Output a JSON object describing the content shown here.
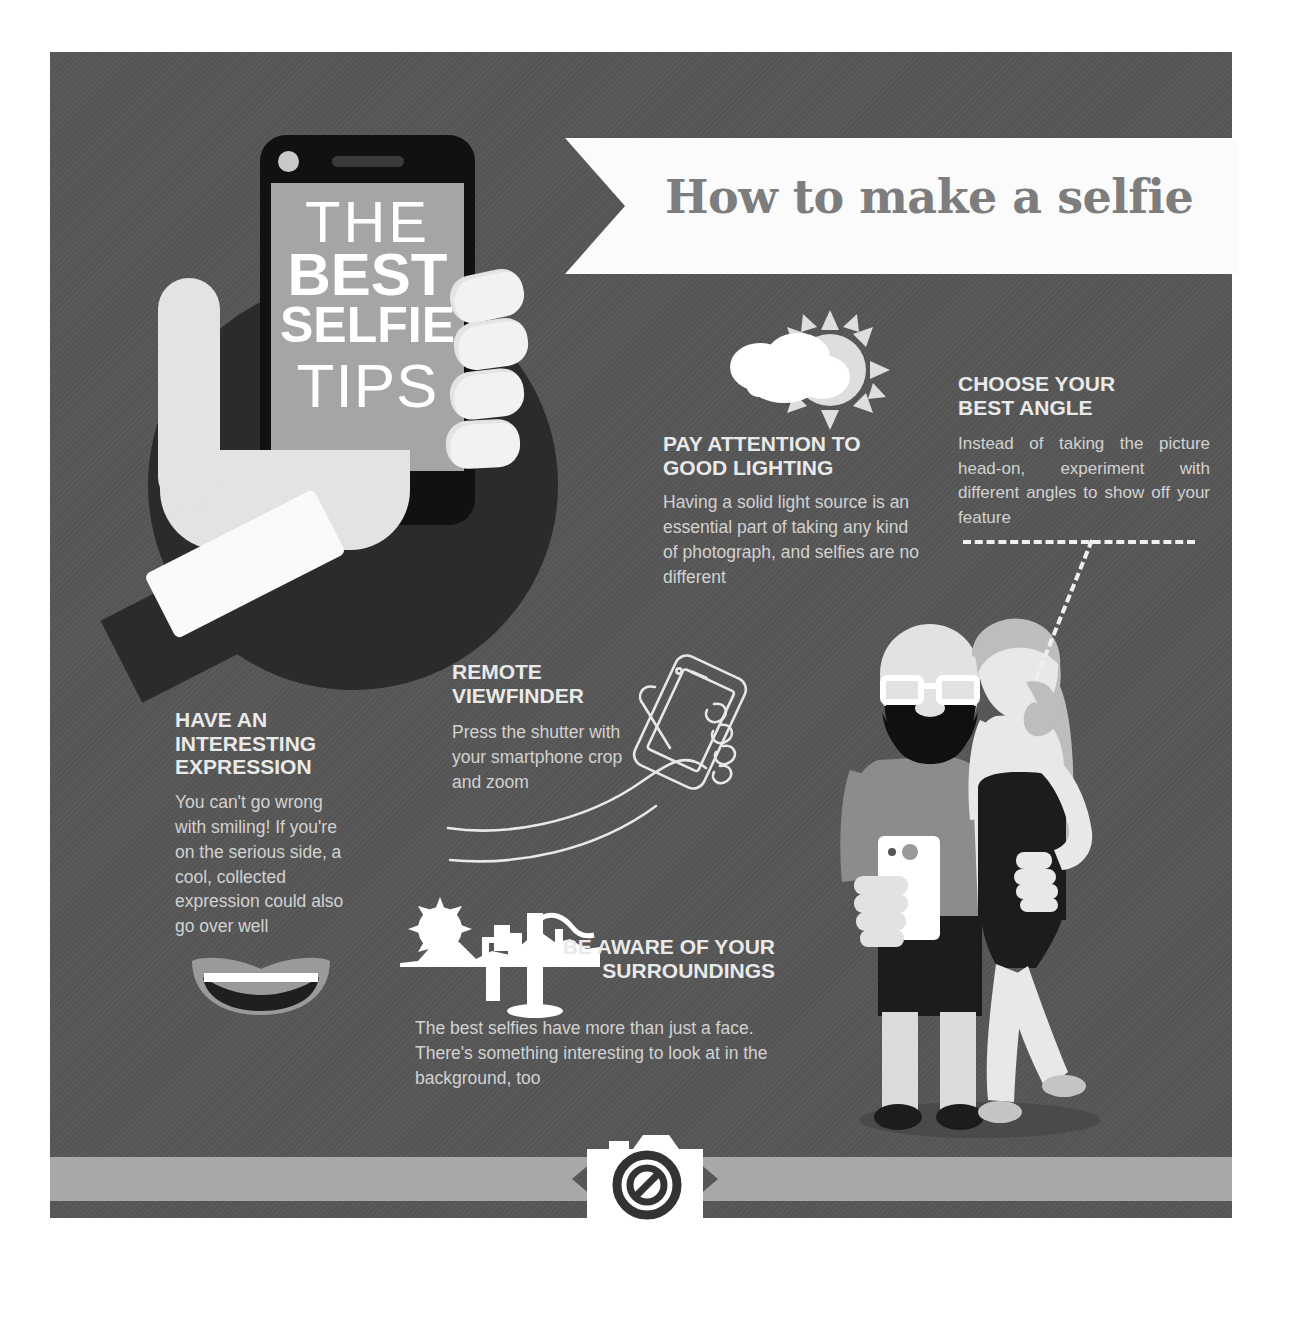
{
  "meta": {
    "canvas_width": 1290,
    "canvas_height": 1326,
    "background_color": "#565656",
    "panel_color": "#565656",
    "accent_light": "#e9e9e9",
    "body_text_color": "#d2d2d2",
    "dark_circle_color": "#2b2b2b",
    "ribbon_color": "#a8a8a8",
    "banner_color": "#fbfbfb",
    "title_color": "#7d7d7d"
  },
  "banner": {
    "title": "How to make a selfie"
  },
  "hero": {
    "screen_lines": {
      "the": "THE",
      "best": "BEST",
      "selfie": "SELFIE",
      "tips": "TIPS"
    },
    "icon_names": {
      "phone": "smartphone-icon",
      "hand": "hand-icon",
      "circle": "background-circle"
    }
  },
  "sections": [
    {
      "id": "lighting",
      "icon": "sun-behind-cloud-icon",
      "heading": "PAY ATTENTION TO\nGOOD LIGHTING",
      "heading_line1": "PAY ATTENTION TO",
      "heading_line2": "GOOD LIGHTING",
      "body": "Having a solid light source is an essential part of taking any kind of photograph, and selfies are no different"
    },
    {
      "id": "angle",
      "icon": "dashed-arrow-icon",
      "heading_line1": "CHOOSE YOUR",
      "heading_line2": "BEST ANGLE",
      "body": "Instead of taking the picture head-on, experiment with different angles to show off your feature"
    },
    {
      "id": "expression",
      "icon": "smiling-mouth-icon",
      "heading_line1": "HAVE AN",
      "heading_line2": "INTERESTING",
      "heading_line3": "EXPRESSION",
      "body": "You can't go wrong with smiling! If you're on the serious side, a cool, collected expression could also go over well"
    },
    {
      "id": "remote-viewfinder",
      "icon": "hand-holding-phone-line-icon",
      "heading_line1": "REMOTE",
      "heading_line2": "VIEWFINDER",
      "body": "Press the shutter with your smartphone crop and zoom"
    },
    {
      "id": "surroundings",
      "icon": "desert-cactus-sun-icon",
      "heading_line1": "BE AWARE OF YOUR",
      "heading_line2": "SURROUNDINGS",
      "body": "The best selfies have more than just a face. There's something interesting to look at in the background, too"
    }
  ],
  "couple": {
    "icon": "couple-taking-selfie-illustration",
    "man": "bearded-man-with-glasses-holding-phone",
    "woman": "woman-in-black-dress-with-ponytail"
  },
  "footer": {
    "icon": "camera-icon",
    "ribbon_left": "ribbon-left-arrow",
    "ribbon_right": "ribbon-right-arrow"
  }
}
